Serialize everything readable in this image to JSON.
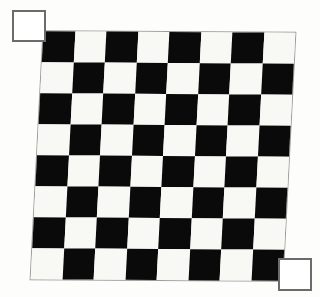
{
  "scene": {
    "title": "Checkerboard calibration pattern",
    "background_color": "#fdfdfb"
  },
  "board": {
    "name": "checkerboard",
    "rows": 8,
    "columns": 8,
    "cell_size_px": 31,
    "dark_color": "#0a0a0a",
    "light_color": "#f8f8f5",
    "top_left_cell": "dark",
    "skew_deg": -2.6,
    "rotation_deg": 0.35,
    "origin_x_px": 37,
    "origin_y_px": 32,
    "width_px": 252,
    "height_px": 248,
    "pattern": [
      [
        "dark",
        "light",
        "dark",
        "light",
        "dark",
        "light",
        "dark",
        "light"
      ],
      [
        "light",
        "dark",
        "light",
        "dark",
        "light",
        "dark",
        "light",
        "dark"
      ],
      [
        "dark",
        "light",
        "dark",
        "light",
        "dark",
        "light",
        "dark",
        "light"
      ],
      [
        "light",
        "dark",
        "light",
        "dark",
        "light",
        "dark",
        "light",
        "dark"
      ],
      [
        "dark",
        "light",
        "dark",
        "light",
        "dark",
        "light",
        "dark",
        "light"
      ],
      [
        "light",
        "dark",
        "light",
        "dark",
        "light",
        "dark",
        "light",
        "dark"
      ],
      [
        "dark",
        "light",
        "dark",
        "light",
        "dark",
        "light",
        "dark",
        "light"
      ],
      [
        "light",
        "dark",
        "light",
        "dark",
        "light",
        "dark",
        "light",
        "dark"
      ]
    ]
  },
  "markers": [
    {
      "id": "marker-top-left",
      "label": "top-left marker square",
      "x": 12,
      "y": 10,
      "width": 34,
      "height": 32,
      "fill_color": "#ffffff",
      "outline_color": "#6b6b6b",
      "outline_width": 2
    },
    {
      "id": "marker-bottom-right",
      "label": "bottom-right marker square",
      "x": 278,
      "y": 258,
      "width": 34,
      "height": 33,
      "fill_color": "#ffffff",
      "outline_color": "#6b6b6b",
      "outline_width": 2
    }
  ]
}
